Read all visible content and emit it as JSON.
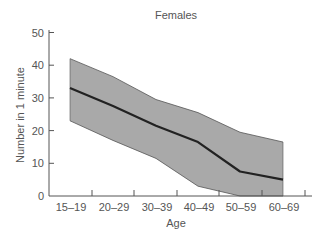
{
  "chart_data": {
    "type": "line",
    "title": "Females",
    "xlabel": "Age",
    "ylabel": "Number in 1 minute",
    "categories": [
      "15–19",
      "20–29",
      "30–39",
      "40–49",
      "50–59",
      "60–69"
    ],
    "series": [
      {
        "name": "Mean",
        "values": [
          33,
          27.5,
          21.5,
          16.5,
          7.5,
          5
        ]
      },
      {
        "name": "Upper bound",
        "values": [
          42,
          36.5,
          29.5,
          25.5,
          19.5,
          16.5
        ]
      },
      {
        "name": "Lower bound",
        "values": [
          23,
          17,
          11.5,
          3,
          0,
          0
        ]
      }
    ],
    "ylim": [
      0,
      50
    ],
    "yticks": [
      0,
      10,
      20,
      30,
      40,
      50
    ],
    "grid": false,
    "legend": "none",
    "colors": {
      "band": "#a9a9a9",
      "band_edge": "#555555",
      "mean_line": "#222222",
      "axis": "#555555",
      "text": "#555555"
    }
  }
}
